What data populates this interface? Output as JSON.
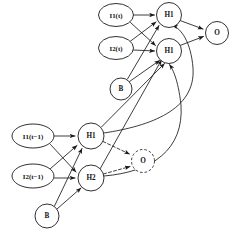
{
  "figure": {
    "type": "neural-network-diagram",
    "background_color": "#ffffff",
    "stroke_color": "#1a1a1a",
    "width": 240,
    "height": 240
  },
  "nodes": {
    "top": [
      {
        "id": "i1_t",
        "label": "I1(t)",
        "shape": "ellipse",
        "style": "solid",
        "cx": 116,
        "cy": 15,
        "rx": 17.5,
        "ry": 11.5
      },
      {
        "id": "i2_t",
        "label": "I2(t)",
        "shape": "ellipse",
        "style": "solid",
        "cx": 116,
        "cy": 48,
        "rx": 17.5,
        "ry": 11.5
      },
      {
        "id": "b_t",
        "label": "B",
        "shape": "circle",
        "style": "solid",
        "cx": 121,
        "cy": 89,
        "rx": 11.0,
        "ry": 11.0
      },
      {
        "id": "h1_t",
        "label": "H1",
        "shape": "circle",
        "style": "solid",
        "cx": 169,
        "cy": 15,
        "rx": 12.5,
        "ry": 12.5
      },
      {
        "id": "h2_t",
        "label": "H1",
        "shape": "circle",
        "style": "solid",
        "cx": 169,
        "cy": 51,
        "rx": 12.5,
        "ry": 12.5
      },
      {
        "id": "o_t",
        "label": "O",
        "shape": "circle",
        "style": "solid",
        "cx": 217,
        "cy": 33,
        "rx": 11.5,
        "ry": 11.5
      }
    ],
    "bottom": [
      {
        "id": "i1_tm1",
        "label": "I1(t−1)",
        "shape": "ellipse",
        "style": "solid",
        "cx": 33,
        "cy": 136,
        "rx": 21.0,
        "ry": 12.0
      },
      {
        "id": "i2_tm1",
        "label": "I2(t−1)",
        "shape": "ellipse",
        "style": "solid",
        "cx": 33,
        "cy": 176,
        "rx": 21.0,
        "ry": 12.0
      },
      {
        "id": "b_tm1",
        "label": "B",
        "shape": "circle",
        "style": "solid",
        "cx": 47,
        "cy": 216,
        "rx": 12.0,
        "ry": 12.0
      },
      {
        "id": "h1_tm1",
        "label": "H1",
        "shape": "circle",
        "style": "solid",
        "cx": 91,
        "cy": 136,
        "rx": 13.0,
        "ry": 13.0
      },
      {
        "id": "h2_tm1",
        "label": "H2",
        "shape": "circle",
        "style": "solid",
        "cx": 91,
        "cy": 178,
        "rx": 13.0,
        "ry": 13.0
      },
      {
        "id": "o_tm1",
        "label": "O",
        "shape": "circle",
        "style": "dashed",
        "cx": 143,
        "cy": 161,
        "rx": 11.5,
        "ry": 11.5
      }
    ]
  },
  "edges": {
    "top_layer": [
      {
        "from": "i1_t",
        "to": "h1_t",
        "style": "solid"
      },
      {
        "from": "i1_t",
        "to": "h2_t",
        "style": "solid"
      },
      {
        "from": "i2_t",
        "to": "h1_t",
        "style": "solid"
      },
      {
        "from": "i2_t",
        "to": "h2_t",
        "style": "solid"
      },
      {
        "from": "b_t",
        "to": "h1_t",
        "style": "solid"
      },
      {
        "from": "b_t",
        "to": "h2_t",
        "style": "solid"
      },
      {
        "from": "h1_t",
        "to": "o_t",
        "style": "solid"
      },
      {
        "from": "h2_t",
        "to": "o_t",
        "style": "solid"
      }
    ],
    "bottom_layer": [
      {
        "from": "i1_tm1",
        "to": "h1_tm1",
        "style": "solid"
      },
      {
        "from": "i1_tm1",
        "to": "h2_tm1",
        "style": "solid"
      },
      {
        "from": "i2_tm1",
        "to": "h1_tm1",
        "style": "solid"
      },
      {
        "from": "i2_tm1",
        "to": "h2_tm1",
        "style": "solid"
      },
      {
        "from": "b_tm1",
        "to": "h1_tm1",
        "style": "solid"
      },
      {
        "from": "b_tm1",
        "to": "h2_tm1",
        "style": "solid"
      },
      {
        "from": "h1_tm1",
        "to": "o_tm1",
        "style": "dashed"
      },
      {
        "from": "h2_tm1",
        "to": "o_tm1",
        "style": "dashed"
      }
    ],
    "recurrent": [
      {
        "from": "h1_tm1",
        "to": "h1_t",
        "style": "solid",
        "shape": "curve"
      },
      {
        "from": "h1_tm1",
        "to": "h2_t",
        "style": "solid",
        "shape": "curve"
      },
      {
        "from": "h2_tm1",
        "to": "h1_t",
        "style": "solid",
        "shape": "curve"
      },
      {
        "from": "h2_tm1",
        "to": "h2_t",
        "style": "solid",
        "shape": "curve"
      }
    ]
  }
}
